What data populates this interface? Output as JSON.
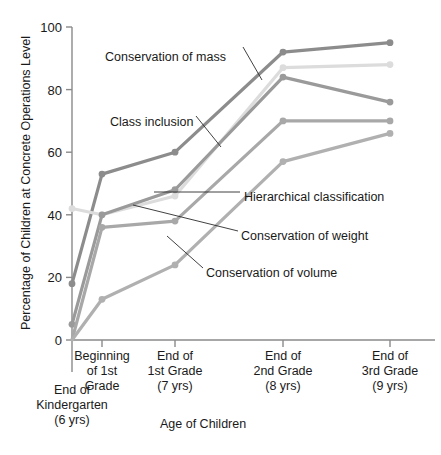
{
  "chart_data": {
    "type": "line",
    "title": "",
    "xlabel": "Age of Children",
    "ylabel": "Percentage of Children at Concrete Operations Level",
    "ylim": [
      0,
      100
    ],
    "yticks": [
      0,
      20,
      40,
      60,
      80,
      100
    ],
    "grid": false,
    "legend_position": "inline-annotations",
    "categories": [
      "End of Kindergarten (6 yrs)",
      "Beginning of 1st Grade",
      "End of 1st Grade (7 yrs)",
      "End of 2nd Grade (8 yrs)",
      "End of 3rd Grade (9 yrs)"
    ],
    "category_lines": [
      [
        "End of",
        "Kindergarten",
        "(6 yrs)"
      ],
      [
        "Beginning",
        "of 1st",
        "Grade"
      ],
      [
        "End of",
        "1st Grade",
        "(7 yrs)"
      ],
      [
        "End of",
        "2nd Grade",
        "(8 yrs)"
      ],
      [
        "End of",
        "3rd Grade",
        "(9 yrs)"
      ]
    ],
    "series": [
      {
        "name": "Conservation of mass",
        "color": "#8c8c8c",
        "values": [
          18,
          53,
          60,
          92,
          95
        ]
      },
      {
        "name": "Class inclusion",
        "color": "#dcdcdc",
        "values": [
          42,
          40,
          46,
          87,
          88
        ]
      },
      {
        "name": "Hierarchical classification",
        "color": "#9a9a9a",
        "values": [
          5,
          40,
          48,
          84,
          76
        ]
      },
      {
        "name": "Conservation of weight",
        "color": "#a8a8a8",
        "values": [
          0,
          36,
          38,
          70,
          70
        ]
      },
      {
        "name": "Conservation of volume",
        "color": "#b0b0b0",
        "values": [
          0,
          13,
          24,
          57,
          66
        ]
      }
    ],
    "annotations": [
      {
        "label": "Conservation of mass",
        "x": 105,
        "y": 50
      },
      {
        "label": "Class inclusion",
        "x": 110,
        "y": 115
      },
      {
        "label": "Hierarchical classification",
        "x": 244,
        "y": 190
      },
      {
        "label": "Conservation of weight",
        "x": 241,
        "y": 229
      },
      {
        "label": "Conservation of volume",
        "x": 206,
        "y": 266
      }
    ]
  },
  "colors": {
    "axis": "#8a8a8a",
    "text": "#1a1a1a",
    "background": "#ffffff"
  }
}
